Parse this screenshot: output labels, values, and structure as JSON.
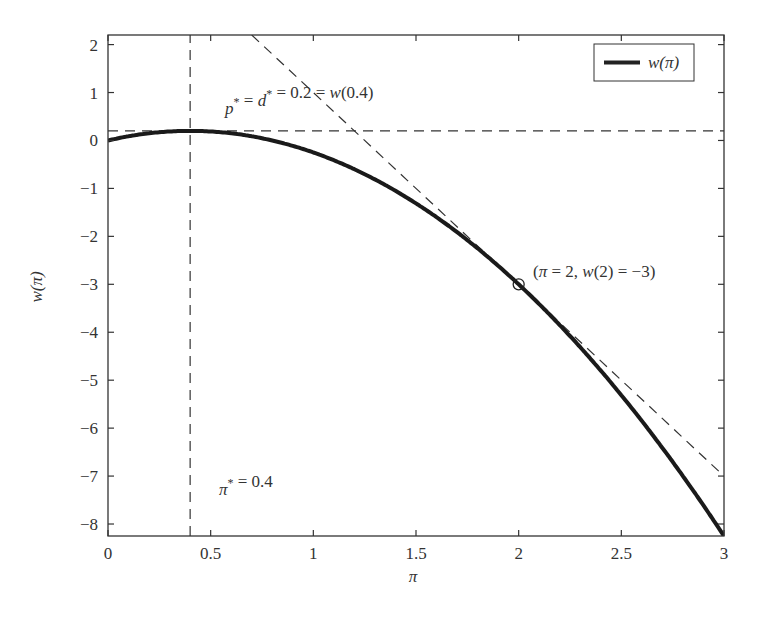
{
  "chart_data": {
    "type": "line",
    "title": "",
    "xlabel": "π",
    "ylabel": "w(π)",
    "xlim": [
      0,
      3
    ],
    "ylim": [
      -8.25,
      2.2
    ],
    "x_ticks": [
      0,
      0.5,
      1,
      1.5,
      2,
      2.5,
      3
    ],
    "x_tick_labels": [
      "0",
      "0.5",
      "1",
      "1.5",
      "2",
      "2.5",
      "3"
    ],
    "y_ticks": [
      2,
      1,
      0,
      -1,
      -2,
      -3,
      -4,
      -5,
      -6,
      -7,
      -8
    ],
    "y_tick_labels": [
      "2",
      "1",
      "0",
      "−1",
      "−2",
      "−3",
      "−4",
      "−5",
      "−6",
      "−7",
      "−8"
    ],
    "grid": false,
    "legend": {
      "position": "upper right",
      "entries": [
        "w(π)"
      ]
    },
    "series": [
      {
        "name": "w(π)",
        "style": "solid-thick",
        "formula": "w(π) = π − 1.25π²",
        "x": [
          0,
          0.2,
          0.4,
          0.6,
          0.8,
          1.0,
          1.2,
          1.4,
          1.6,
          1.8,
          2.0,
          2.2,
          2.4,
          2.6,
          2.8,
          3.0
        ],
        "values": [
          0,
          0.15,
          0.2,
          0.15,
          0.0,
          -0.25,
          -0.6,
          -1.05,
          -1.6,
          -2.25,
          -3.0,
          -3.85,
          -4.8,
          -5.85,
          -7.0,
          -8.25
        ]
      },
      {
        "name": "tangent at π=2",
        "style": "dashed",
        "formula": "y = 5 − 4π",
        "x": [
          0.7,
          3.0
        ],
        "values": [
          2.2,
          -7.0
        ]
      },
      {
        "name": "optimal value line",
        "style": "dashed",
        "x": [
          0,
          3
        ],
        "values": [
          0.2,
          0.2
        ]
      },
      {
        "name": "optimal π line",
        "style": "dashed-vertical",
        "x": [
          0.4,
          0.4
        ],
        "values": [
          -8.25,
          2.2
        ]
      }
    ],
    "markers": [
      {
        "x": 2,
        "y": -3,
        "shape": "open-circle"
      }
    ],
    "annotations": [
      {
        "text_parts": [
          "p",
          "*",
          " = ",
          "d",
          "*",
          " = 0.2 = ",
          "w",
          "(0.4)"
        ],
        "x": 0.57,
        "y": 0.55
      },
      {
        "text_parts": [
          "(",
          "π",
          " = 2, ",
          "w",
          "(2) = −3)"
        ],
        "x": 2.07,
        "y": -2.85
      },
      {
        "text_parts": [
          "π",
          "*",
          " = 0.4"
        ],
        "x": 0.54,
        "y": -7.4
      }
    ]
  }
}
